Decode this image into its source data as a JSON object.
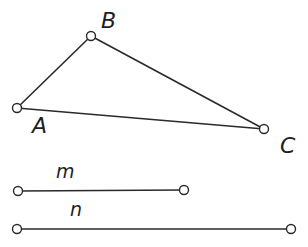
{
  "diagram": {
    "type": "geometry-figure",
    "triangle": {
      "points": [
        {
          "id": "A",
          "label": "A",
          "x": 17,
          "y": 108,
          "label_x": 32,
          "label_y": 133
        },
        {
          "id": "B",
          "label": "B",
          "x": 91,
          "y": 36,
          "label_x": 101,
          "label_y": 28
        },
        {
          "id": "C",
          "label": "C",
          "x": 264,
          "y": 129,
          "label_x": 280,
          "label_y": 153
        }
      ],
      "sides": [
        [
          "A",
          "B"
        ],
        [
          "B",
          "C"
        ],
        [
          "C",
          "A"
        ]
      ]
    },
    "segments": [
      {
        "id": "m",
        "label": "m",
        "x1": 18,
        "y1": 191,
        "x2": 184,
        "y2": 190,
        "label_x": 56,
        "label_y": 178
      },
      {
        "id": "n",
        "label": "n",
        "x1": 17,
        "y1": 229,
        "x2": 291,
        "y2": 229,
        "label_x": 70,
        "label_y": 216
      }
    ],
    "colors": {
      "stroke": "#2a2a2a",
      "background": "#ffffff"
    }
  }
}
